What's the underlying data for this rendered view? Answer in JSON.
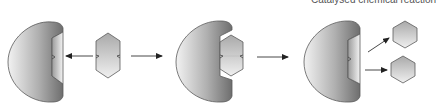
{
  "diagram": {
    "type": "enzyme-substrate reaction sequence",
    "caption": "Catalysed chemical reaction",
    "colors": {
      "enzyme_dark": "#7a7a7a",
      "enzyme_light": "#f0f0f0",
      "outline": "#5a5a5a",
      "substrate_light": "#eeeeee",
      "substrate_dark": "#a8a8a8",
      "arrow": "#333333"
    },
    "stages": [
      {
        "id": "enzyme-and-substrate",
        "label": "Enzyme with empty active site; substrate approaching"
      },
      {
        "id": "enzyme-substrate-complex",
        "label": "Substrate bound in active site"
      },
      {
        "id": "enzyme-and-products",
        "label": "Enzyme released; two product molecules"
      }
    ]
  }
}
